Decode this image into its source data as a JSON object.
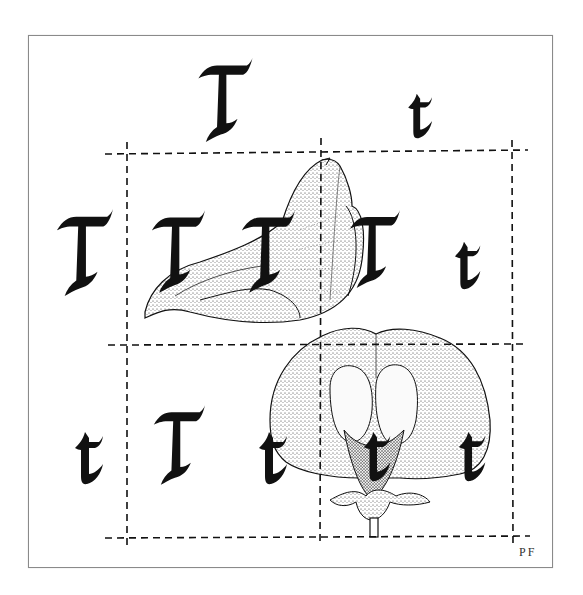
{
  "figure": {
    "colors": {
      "ink": "#111111",
      "frame": "#8a8a8a",
      "background": "#ffffff",
      "stipple": "#2a2a2a"
    },
    "signature": "PF"
  },
  "alleles": {
    "parent_top": [
      {
        "label": "T",
        "x": 193,
        "y": 58,
        "w": 63,
        "h": 84
      },
      {
        "label": "t",
        "x": 407,
        "y": 92,
        "w": 28,
        "h": 47
      }
    ],
    "parent_left": [
      {
        "label": "T",
        "x": 55,
        "y": 208,
        "w": 58,
        "h": 89
      },
      {
        "label": "t",
        "x": 75,
        "y": 430,
        "w": 30,
        "h": 55
      }
    ],
    "cells": [
      {
        "id": "TT",
        "labels": [
          {
            "label": "T",
            "x": 150,
            "y": 207,
            "w": 55,
            "h": 89
          },
          {
            "label": "T",
            "x": 240,
            "y": 207,
            "w": 55,
            "h": 89
          }
        ]
      },
      {
        "id": "Tt-top-right",
        "labels": [
          {
            "label": "T",
            "x": 348,
            "y": 207,
            "w": 52,
            "h": 84
          },
          {
            "label": "t",
            "x": 452,
            "y": 240,
            "w": 33,
            "h": 50
          }
        ]
      },
      {
        "id": "Tt-bottom-left",
        "labels": [
          {
            "label": "T",
            "x": 152,
            "y": 400,
            "w": 53,
            "h": 90
          },
          {
            "label": "t",
            "x": 258,
            "y": 430,
            "w": 32,
            "h": 55
          }
        ]
      },
      {
        "id": "tt",
        "labels": [
          {
            "label": "t",
            "x": 363,
            "y": 430,
            "w": 30,
            "h": 52
          },
          {
            "label": "t",
            "x": 458,
            "y": 430,
            "w": 30,
            "h": 52
          }
        ]
      }
    ]
  },
  "grid": {
    "lines": {
      "top_y": 152,
      "middle_y": 345,
      "bottom_y": 537,
      "left_x": 127,
      "middle_x": 321,
      "right_x": 512
    }
  },
  "illustrations": [
    {
      "name": "pea-flower-side-view",
      "x": 140,
      "y": 158,
      "w": 225,
      "h": 164
    },
    {
      "name": "pea-flower-front-view",
      "x": 268,
      "y": 328,
      "w": 222,
      "h": 209
    }
  ]
}
